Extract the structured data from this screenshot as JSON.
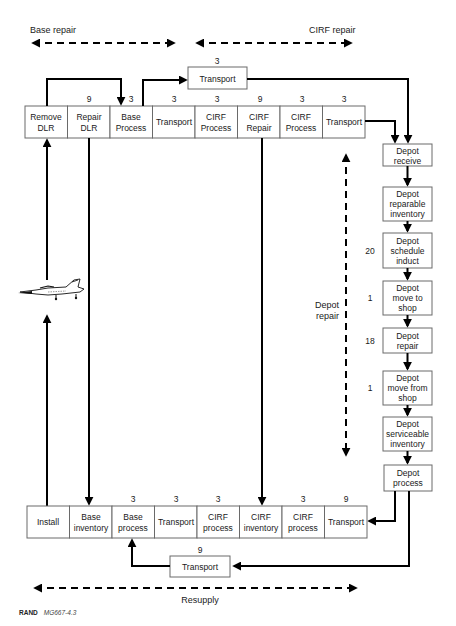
{
  "phases": {
    "base_repair": "Base repair",
    "cirf_repair": "CIRF repair",
    "depot_repair_line1": "Depot",
    "depot_repair_line2": "repair",
    "resupply": "Resupply"
  },
  "top_transport": {
    "label": "Transport",
    "value": "3"
  },
  "top_row": [
    {
      "line1": "Remove",
      "line2": "DLR",
      "value": ""
    },
    {
      "line1": "Repair",
      "line2": "DLR",
      "value": "9"
    },
    {
      "line1": "Base",
      "line2": "Process",
      "value": "3"
    },
    {
      "line1": "Transport",
      "line2": "",
      "value": "3"
    },
    {
      "line1": "CIRF",
      "line2": "Process",
      "value": "3"
    },
    {
      "line1": "CIRF",
      "line2": "Repair",
      "value": "9"
    },
    {
      "line1": "CIRF",
      "line2": "Process",
      "value": "3"
    },
    {
      "line1": "Transport",
      "line2": "",
      "value": "3"
    }
  ],
  "depot_column": [
    {
      "lines": [
        "Depot",
        "receive"
      ],
      "value": ""
    },
    {
      "lines": [
        "Depot",
        "reparable",
        "inventory"
      ],
      "value": ""
    },
    {
      "lines": [
        "Depot",
        "schedule",
        "induct"
      ],
      "value": "20"
    },
    {
      "lines": [
        "Depot",
        "move to",
        "shop"
      ],
      "value": "1"
    },
    {
      "lines": [
        "Depot",
        "repair"
      ],
      "value": "18"
    },
    {
      "lines": [
        "Depot",
        "move from",
        "shop"
      ],
      "value": "1"
    },
    {
      "lines": [
        "Depot",
        "serviceable",
        "inventory"
      ],
      "value": ""
    },
    {
      "lines": [
        "Depot",
        "process"
      ],
      "value": ""
    }
  ],
  "bottom_row": [
    {
      "line1": "Install",
      "line2": "",
      "value": ""
    },
    {
      "line1": "Base",
      "line2": "inventory",
      "value": ""
    },
    {
      "line1": "Base",
      "line2": "process",
      "value": "3"
    },
    {
      "line1": "Transport",
      "line2": "",
      "value": "3"
    },
    {
      "line1": "CIRF",
      "line2": "process",
      "value": "3"
    },
    {
      "line1": "CIRF",
      "line2": "inventory",
      "value": ""
    },
    {
      "line1": "CIRF",
      "line2": "process",
      "value": "3"
    },
    {
      "line1": "Transport",
      "line2": "",
      "value": "9"
    }
  ],
  "bottom_transport": {
    "label": "Transport",
    "value": "9"
  },
  "aircraft": {
    "icon": "fighter-jet-icon"
  },
  "credit": {
    "org": "RAND",
    "figure_id": "MG667-4.3"
  }
}
